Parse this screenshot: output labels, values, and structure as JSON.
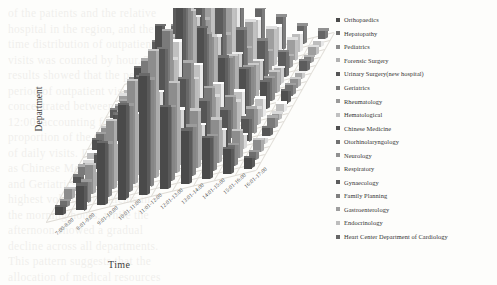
{
  "chart_data": {
    "type": "bar",
    "subtype": "3d-grouped-bar",
    "title": "",
    "xlabel": "Time",
    "ylabel": "Department",
    "zlabel": "",
    "grid": true,
    "legend_position": "right",
    "palette": "grayscale",
    "categories": [
      "7:00-8:00",
      "8:01-9:00",
      "9:01-10:00",
      "10:01-11:00",
      "11:01-12:00",
      "12:01-13:00",
      "13:01-14:00",
      "14:01-15:00",
      "15:01-16:00",
      "16:01-17:00"
    ],
    "series": [
      {
        "name": "Orthopaedics",
        "color": "#4a4a4a",
        "values": [
          4,
          12,
          30,
          46,
          58,
          40,
          26,
          20,
          12,
          5
        ]
      },
      {
        "name": "Hepatopathy",
        "color": "#6e6e6e",
        "values": [
          3,
          10,
          26,
          42,
          52,
          36,
          24,
          17,
          10,
          4
        ]
      },
      {
        "name": "Pediatrics",
        "color": "#8d8d8d",
        "values": [
          5,
          14,
          33,
          50,
          62,
          44,
          28,
          21,
          13,
          6
        ]
      },
      {
        "name": "Forensic Surgery",
        "color": "#b2b2b2",
        "values": [
          2,
          7,
          18,
          30,
          38,
          27,
          17,
          12,
          7,
          3
        ]
      },
      {
        "name": "Urinary Surgery(new hospital)",
        "color": "#555555",
        "values": [
          3,
          11,
          28,
          44,
          55,
          38,
          25,
          18,
          11,
          4
        ]
      },
      {
        "name": "Geriatrics",
        "color": "#7a7a7a",
        "values": [
          4,
          13,
          31,
          48,
          60,
          42,
          27,
          20,
          12,
          5
        ]
      },
      {
        "name": "Rheumatology",
        "color": "#999999",
        "values": [
          2,
          8,
          20,
          33,
          42,
          30,
          19,
          14,
          8,
          3
        ]
      },
      {
        "name": "Hematological",
        "color": "#c0c0c0",
        "values": [
          3,
          9,
          23,
          37,
          47,
          33,
          21,
          15,
          9,
          4
        ]
      },
      {
        "name": "Chinese Medicine",
        "color": "#4f4f4f",
        "values": [
          5,
          15,
          35,
          53,
          66,
          47,
          30,
          22,
          13,
          6
        ]
      },
      {
        "name": "Otorhinolaryngology",
        "color": "#717171",
        "values": [
          4,
          12,
          29,
          45,
          57,
          40,
          26,
          19,
          11,
          5
        ]
      },
      {
        "name": "Neurology",
        "color": "#909090",
        "values": [
          3,
          10,
          25,
          40,
          50,
          35,
          23,
          16,
          10,
          4
        ]
      },
      {
        "name": "Respiratory",
        "color": "#a8a8a8",
        "values": [
          2,
          8,
          21,
          34,
          43,
          31,
          20,
          14,
          8,
          3
        ]
      },
      {
        "name": "Gynaecology",
        "color": "#5c5c5c",
        "values": [
          4,
          13,
          32,
          49,
          61,
          43,
          28,
          20,
          12,
          5
        ]
      },
      {
        "name": "Family Planning",
        "color": "#7f7f7f",
        "values": [
          2,
          6,
          16,
          27,
          34,
          24,
          15,
          11,
          6,
          3
        ]
      },
      {
        "name": "Gastroenterology",
        "color": "#9e9e9e",
        "values": [
          3,
          11,
          27,
          43,
          54,
          38,
          24,
          18,
          10,
          4
        ]
      },
      {
        "name": "Endocrinology",
        "color": "#bdbdbd",
        "values": [
          2,
          9,
          22,
          36,
          45,
          32,
          21,
          15,
          9,
          3
        ]
      },
      {
        "name": "Heart Center Department of Cardiology",
        "color": "#666666",
        "values": [
          3,
          10,
          24,
          39,
          49,
          34,
          22,
          16,
          9,
          4
        ]
      }
    ],
    "zlim": [
      0,
      70
    ]
  },
  "legend": {
    "items": [
      {
        "label": "Orthopaedics",
        "color": "#4a4a4a"
      },
      {
        "label": "Hepatopathy",
        "color": "#6e6e6e"
      },
      {
        "label": "Pediatrics",
        "color": "#8d8d8d"
      },
      {
        "label": "Forensic Surgery",
        "color": "#b2b2b2"
      },
      {
        "label": "Urinary Surgery(new hospital)",
        "color": "#555555"
      },
      {
        "label": "Geriatrics",
        "color": "#7a7a7a"
      },
      {
        "label": "Rheumatology",
        "color": "#999999"
      },
      {
        "label": "Hematological",
        "color": "#c0c0c0"
      },
      {
        "label": "Chinese Medicine",
        "color": "#4f4f4f"
      },
      {
        "label": "Otorhinolaryngology",
        "color": "#717171"
      },
      {
        "label": "Neurology",
        "color": "#909090"
      },
      {
        "label": "Respiratory",
        "color": "#a8a8a8"
      },
      {
        "label": "Gynaecology",
        "color": "#5c5c5c"
      },
      {
        "label": "Family Planning",
        "color": "#7f7f7f"
      },
      {
        "label": "Gastroenterology",
        "color": "#9e9e9e"
      },
      {
        "label": "Endocrinology",
        "color": "#bdbdbd"
      },
      {
        "label": "Heart Center Department of Cardiology",
        "color": "#666666"
      }
    ]
  },
  "axes": {
    "x_title": "Time",
    "y_title": "Department"
  },
  "background_text": [
    "of the patients and the relative",
    "hospital in the region, and the",
    "time distribution of outpatient",
    "visits was counted by hour. The",
    "results showed that the peak",
    "period of outpatient visits was",
    "concentrated between 10:01 and",
    "12:00, accounting for a large",
    "proportion of the total number",
    "of daily visits. Departments such",
    "as Chinese Medicine, Pediatrics",
    "and Geriatrics received the",
    "highest volume of patients in",
    "the morning hours, while the",
    "afternoon showed a gradual",
    "decline across all departments.",
    "This pattern suggests that the",
    "allocation of medical resources",
    "should be adjusted according to"
  ]
}
